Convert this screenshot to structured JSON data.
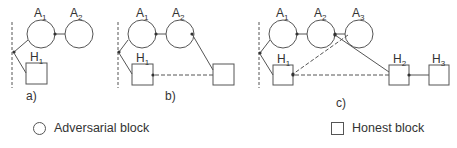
{
  "diagram": {
    "panels": [
      {
        "label": "a)",
        "adversarial": [
          {
            "name": "A",
            "sub": "1"
          },
          {
            "name": "A",
            "sub": "2"
          }
        ],
        "honest": [
          {
            "name": "H",
            "sub": "1"
          }
        ]
      },
      {
        "label": "b)",
        "adversarial": [
          {
            "name": "A",
            "sub": "1"
          },
          {
            "name": "A",
            "sub": "2"
          }
        ],
        "honest": [
          {
            "name": "H",
            "sub": "1"
          },
          {
            "name": "",
            "sub": ""
          }
        ]
      },
      {
        "label": "c)",
        "adversarial": [
          {
            "name": "A",
            "sub": "1"
          },
          {
            "name": "A",
            "sub": "2"
          },
          {
            "name": "A",
            "sub": "3"
          }
        ],
        "honest": [
          {
            "name": "H",
            "sub": "1"
          },
          {
            "name": "H",
            "sub": "2"
          },
          {
            "name": "H",
            "sub": "3"
          }
        ]
      }
    ],
    "legend": {
      "adversarial": "Adversarial block",
      "honest": "Honest block"
    },
    "colors": {
      "stroke": "#555555",
      "text": "#333333"
    }
  }
}
